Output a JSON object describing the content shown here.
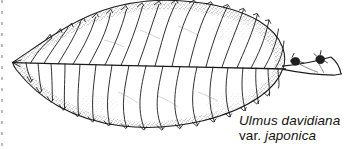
{
  "figure": {
    "kind": "botanical-line-drawing",
    "background_color": "#ffffff",
    "ink_color": "#1a1a1a",
    "width": 354,
    "height": 149
  },
  "caption": {
    "species_line": "Ulmus davidiana",
    "rank_abbrev": "var.",
    "variety_line": "japonica",
    "color": "#16120f"
  },
  "illustration": {
    "leaf": {
      "label": "leaf-blade",
      "apex_direction": "left",
      "base_direction": "right",
      "margin": "doubly-serrate",
      "base_shape": "oblique-asymmetric",
      "shading": "stippled-margin"
    },
    "midrib": {
      "label": "midrib"
    },
    "secondary_veins": {
      "label": "secondary-veins",
      "count": 28
    },
    "twig": {
      "label": "twig"
    },
    "buds": {
      "label": "buds",
      "count": 2
    },
    "scan_edge": {
      "label": "page-scan-edge"
    }
  }
}
